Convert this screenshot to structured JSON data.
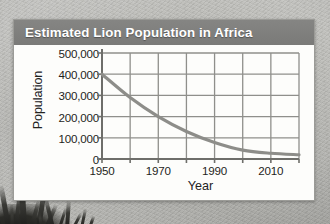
{
  "chart_data": {
    "type": "line",
    "title": "Estimated Lion Population in Africa",
    "xlabel": "Year",
    "ylabel": "Population",
    "x": [
      1950,
      1960,
      1970,
      1980,
      1990,
      2000,
      2010,
      2020
    ],
    "values": [
      400000,
      290000,
      200000,
      130000,
      78000,
      42000,
      27000,
      20000
    ],
    "xlim": [
      1950,
      2020
    ],
    "ylim": [
      0,
      500000
    ],
    "x_tick_values": [
      1950,
      1960,
      1970,
      1980,
      1990,
      2000,
      2010,
      2020
    ],
    "x_tick_labels": [
      "1950",
      "",
      "1970",
      "",
      "1990",
      "",
      "2010",
      ""
    ],
    "y_tick_values": [
      0,
      100000,
      200000,
      300000,
      400000,
      500000
    ],
    "y_tick_labels": [
      "0",
      "100,000",
      "200,000",
      "300,000",
      "400,000",
      "500,000"
    ],
    "grid": true,
    "legend": null,
    "line_color": "#8d8d89",
    "grid_color": "#8f8f8b",
    "axis_color": "#6e6e6a"
  },
  "card": {
    "header_bg": "#7d7d7b",
    "title_color": "#ffffff",
    "body_bg": "#fdfdfb"
  },
  "background": {
    "kind": "photo-backdrop",
    "base_color": "#b5b5b1",
    "foliage_color": "#202020"
  }
}
